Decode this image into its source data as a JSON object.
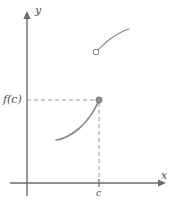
{
  "figure": {
    "type": "cartesian-graph",
    "width": 175,
    "height": 207,
    "background": "#ffffff"
  },
  "colors": {
    "axis": "#6b6b6b",
    "curve": "#8a8a8a",
    "dashed": "#9a9a9a",
    "point_fill": "#8a8a8a",
    "point_stroke": "#6b6b6b",
    "text": "#4d4d4d"
  },
  "axes": {
    "origin": {
      "x": 27,
      "y": 183
    },
    "x_axis": {
      "label": "x",
      "start": {
        "x": 10,
        "y": 183
      },
      "end": {
        "x": 160,
        "y": 183
      },
      "arrow": true,
      "label_position": {
        "x": 161,
        "y": 170
      }
    },
    "y_axis": {
      "label": "y",
      "start": {
        "x": 27,
        "y": 196
      },
      "end": {
        "x": 27,
        "y": 12
      },
      "arrow": true,
      "label_position": {
        "x": 35,
        "y": 5
      }
    }
  },
  "ticks": [
    {
      "name": "c-tick",
      "label": "c",
      "axis": "x",
      "position": {
        "x": 99,
        "y": 183
      },
      "label_position": {
        "x": 96,
        "y": 189
      }
    }
  ],
  "value_labels": [
    {
      "name": "f-of-c",
      "label": "f(c)",
      "axis": "y",
      "position": {
        "x": 27,
        "y": 100
      },
      "label_position": {
        "x": 3,
        "y": 94
      }
    }
  ],
  "curves": [
    {
      "name": "upper-branch",
      "path": "M 96 52 C 104 44, 114 34, 128 29",
      "stroke_width": 1.2,
      "endpoint_left": {
        "x": 96,
        "y": 52,
        "marker": "open-circle"
      },
      "endpoint_right": {
        "x": 128,
        "y": 29,
        "marker": "none"
      }
    },
    {
      "name": "lower-branch",
      "path": "M 56 140 C 70 138, 88 124, 99 100",
      "stroke_width": 1.6,
      "endpoint_left": {
        "x": 56,
        "y": 140,
        "marker": "none"
      },
      "endpoint_right": {
        "x": 99,
        "y": 100,
        "marker": "filled-circle"
      }
    }
  ],
  "markers": [
    {
      "name": "open-circle-point",
      "type": "open",
      "x": 96,
      "y": 52,
      "radius": 2.8,
      "meaning": "limit value not attained"
    },
    {
      "name": "filled-circle-point",
      "type": "filled",
      "x": 99,
      "y": 100,
      "radius": 3.1,
      "meaning": "f(c) value"
    }
  ],
  "guides": [
    {
      "name": "horizontal-guide",
      "orientation": "horizontal",
      "from": {
        "x": 27,
        "y": 100
      },
      "to": {
        "x": 99,
        "y": 100
      },
      "style": "dashed",
      "dash": "4 3"
    },
    {
      "name": "vertical-guide",
      "orientation": "vertical",
      "from": {
        "x": 99,
        "y": 100
      },
      "to": {
        "x": 99,
        "y": 183
      },
      "style": "dashed",
      "dash": "4 3"
    }
  ]
}
